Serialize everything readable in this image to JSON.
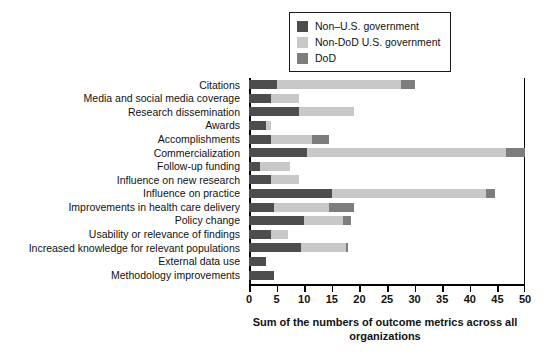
{
  "chart_data": {
    "type": "bar",
    "orientation": "horizontal",
    "stacked": true,
    "title": "",
    "xlabel": "Sum of the numbers of outcome metrics across all organizations",
    "ylabel": "",
    "xlim": [
      0,
      50
    ],
    "xticks": [
      0,
      5,
      10,
      15,
      20,
      25,
      30,
      35,
      40,
      45,
      50
    ],
    "grid": false,
    "legend_position": "top-right",
    "categories": [
      "Citations",
      "Media and social media coverage",
      "Research dissemination",
      "Awards",
      "Accomplishments",
      "Commercialization",
      "Follow-up funding",
      "Influence on new research",
      "Influence on practice",
      "Improvements in health care delivery",
      "Policy change",
      "Usability or relevance of findings",
      "Increased knowledge for relevant populations",
      "External data use",
      "Methodology improvements"
    ],
    "series": [
      {
        "name": "Non–U.S. government",
        "color": "#4d4d4d",
        "values": [
          5,
          4,
          9,
          3,
          4,
          10.5,
          2,
          4,
          15,
          4.5,
          10,
          4,
          9.5,
          3,
          4.5
        ]
      },
      {
        "name": "Non-DoD U.S. government",
        "color": "#c8c8c8",
        "values": [
          22.5,
          5,
          10,
          1,
          7.5,
          36,
          5.5,
          5,
          28,
          10,
          7,
          3,
          8,
          0,
          0
        ]
      },
      {
        "name": "DoD",
        "color": "#7d7d7d",
        "values": [
          2.5,
          0,
          0,
          0,
          3,
          3.5,
          0,
          0,
          1.5,
          4.5,
          1.5,
          0,
          0.5,
          0,
          0
        ]
      }
    ],
    "totals": [
      30,
      9,
      19,
      4,
      14.5,
      50,
      7.5,
      9,
      44.5,
      19,
      18.5,
      7,
      18,
      3,
      4.5
    ]
  },
  "legend": {
    "items": [
      {
        "label": "Non–U.S. government",
        "color": "#4d4d4d"
      },
      {
        "label": "Non-DoD U.S. government",
        "color": "#c8c8c8"
      },
      {
        "label": "DoD",
        "color": "#7d7d7d"
      }
    ]
  },
  "axis": {
    "x_title": "Sum of the numbers of outcome metrics across all organizations",
    "x_tick_labels": [
      "0",
      "5",
      "10",
      "15",
      "20",
      "25",
      "30",
      "35",
      "40",
      "45",
      "50"
    ]
  }
}
